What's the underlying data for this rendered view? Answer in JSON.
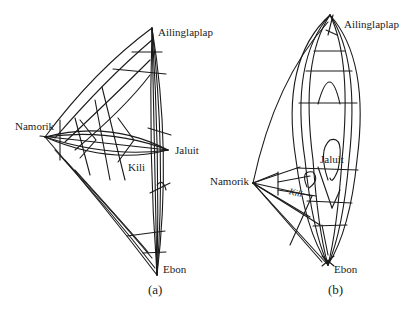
{
  "figure": {
    "panels": [
      {
        "id": "a",
        "caption": "(a)",
        "labels": {
          "top": "Ailinglaplap",
          "left": "Namorik",
          "right": "Jaluit",
          "middle": "Kili",
          "bottom": "Ebon"
        }
      },
      {
        "id": "b",
        "caption": "(b)",
        "labels": {
          "top": "Ailinglaplap",
          "left": "Namorik",
          "right": "Jaluit",
          "middle": "Kili",
          "bottom": "Ebon"
        }
      }
    ],
    "colors": {
      "stroke": "#1a1a1a",
      "text": "#222222",
      "background": "#ffffff"
    }
  }
}
